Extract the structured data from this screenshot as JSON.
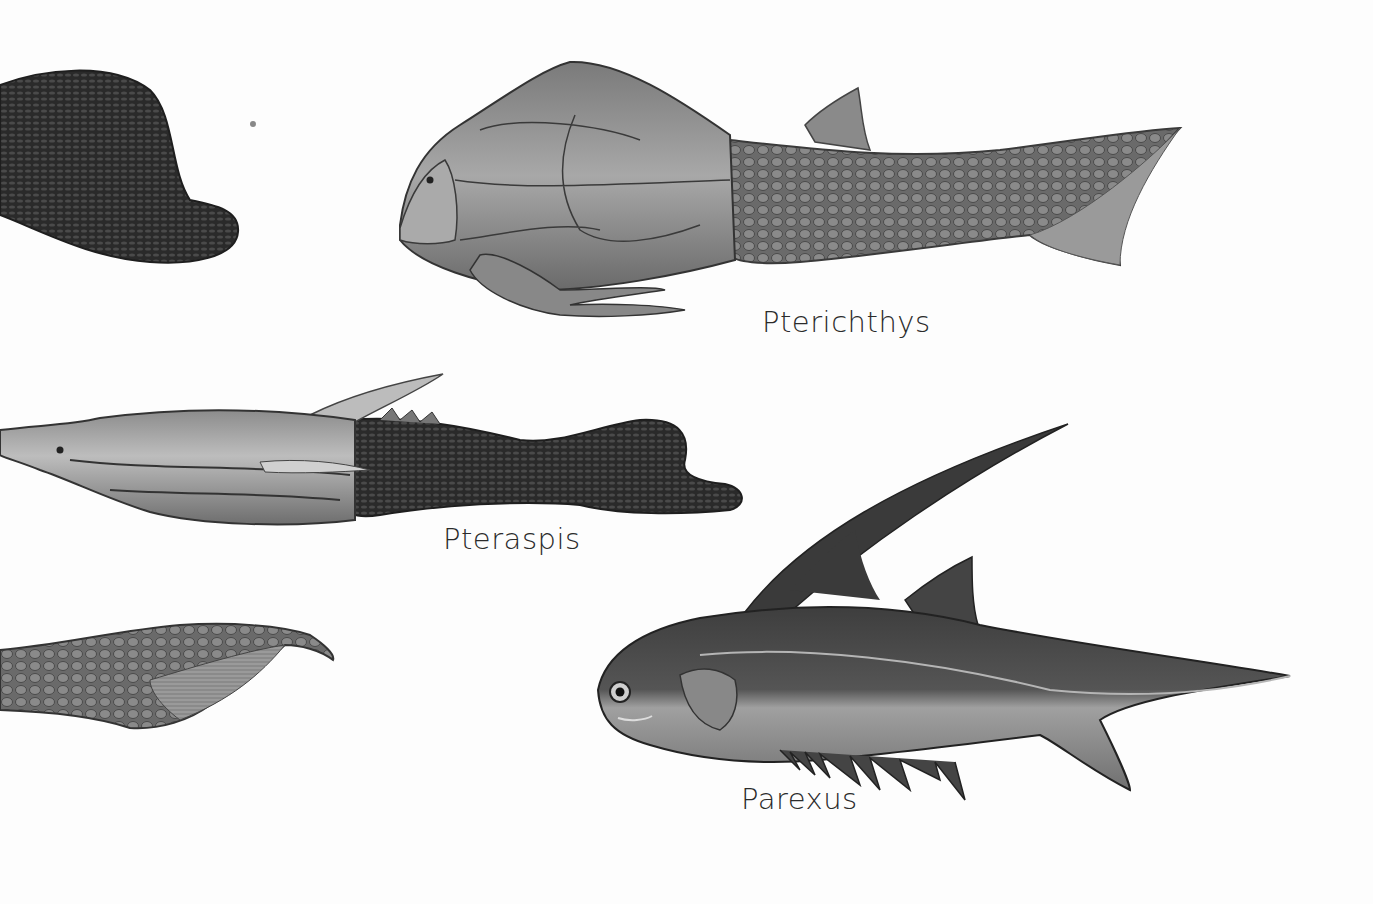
{
  "plate": {
    "type": "natural-history illustration of Devonian fishes",
    "background": "#fdfdfd",
    "ink": "#2b2b2b"
  },
  "specimens": [
    {
      "name": "Pterichthys",
      "label_pos": [
        762,
        305
      ]
    },
    {
      "name": "Pteraspis",
      "label_pos": [
        443,
        522
      ]
    },
    {
      "name": "Parexus",
      "label_pos": [
        741,
        782
      ]
    }
  ],
  "partial_specimens": [
    {
      "description": "dark scaly tail fragment (top-left, cropped)"
    },
    {
      "description": "scaled heterocercal tail fragment (bottom-left, cropped)"
    }
  ]
}
